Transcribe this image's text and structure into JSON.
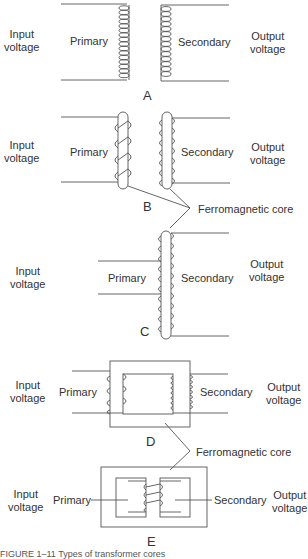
{
  "figure": {
    "panels": [
      {
        "id": "A",
        "label": "A",
        "input": "Input\nvoltage",
        "primary": "Primary",
        "secondary": "Secondary",
        "output": "Output\nvoltage"
      },
      {
        "id": "B",
        "label": "B",
        "input": "Input\nvoltage",
        "primary": "Primary",
        "secondary": "Secondary",
        "output": "Output\nvoltage"
      },
      {
        "id": "C",
        "label": "C",
        "input": "Input\nvoltage",
        "primary": "Primary",
        "secondary": "Secondary",
        "output": "Output\nvoltage"
      },
      {
        "id": "D",
        "label": "D",
        "input": "Input\nvoltage",
        "primary": "Primary",
        "secondary": "Secondary",
        "output": "Output\nvoltage"
      },
      {
        "id": "E",
        "label": "E",
        "input": "Input\nvoltage",
        "primary": "Primary",
        "secondary": "Secondary",
        "output": "Output\nvoltage"
      }
    ],
    "callouts": {
      "core_top": "Ferromagnetic core",
      "core_bottom": "Ferromagnetic core"
    },
    "caption": "FIGURE 1–11  Types of transformer cores"
  }
}
